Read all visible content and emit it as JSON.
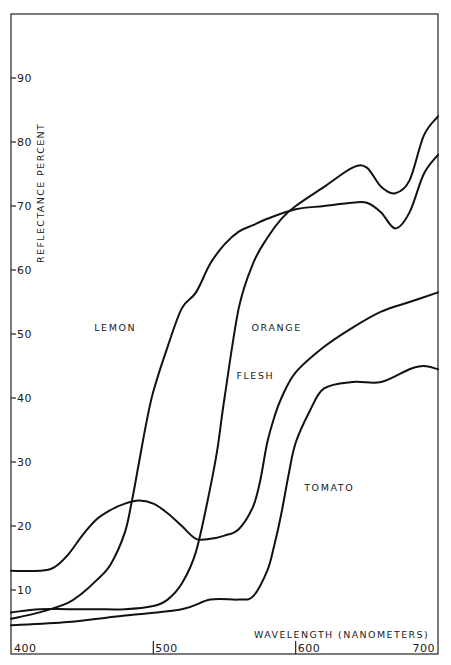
{
  "chart_data": {
    "type": "line",
    "title": "",
    "xlabel": "WAVELENGTH (NANOMETERS)",
    "ylabel": "REFLECTANCE PERCENT",
    "xlim": [
      400,
      700
    ],
    "ylim": [
      0,
      100
    ],
    "grid": false,
    "legend": "inline labels",
    "x_ticks": [
      {
        "value": 400,
        "label": "400"
      },
      {
        "value": 500,
        "label": "500"
      },
      {
        "value": 600,
        "label": "600"
      },
      {
        "value": 700,
        "label": "700"
      }
    ],
    "y_ticks": [
      {
        "value": 10,
        "label": "10"
      },
      {
        "value": 20,
        "label": "20"
      },
      {
        "value": 30,
        "label": "30"
      },
      {
        "value": 40,
        "label": "40"
      },
      {
        "value": 50,
        "label": "50"
      },
      {
        "value": 60,
        "label": "60"
      },
      {
        "value": 70,
        "label": "70"
      },
      {
        "value": 80,
        "label": "80"
      },
      {
        "value": 90,
        "label": "90"
      }
    ],
    "series": [
      {
        "name": "LEMON",
        "label_pos": {
          "x": 488,
          "y": 50.5
        },
        "x": [
          400,
          420,
          440,
          450,
          460,
          470,
          480,
          485,
          490,
          495,
          500,
          510,
          520,
          530,
          540,
          550,
          560,
          570,
          580,
          600,
          620,
          640,
          650,
          660,
          670,
          680,
          690,
          700
        ],
        "values": [
          5.5,
          6.5,
          8,
          9.5,
          11.5,
          14,
          19,
          24,
          30,
          36,
          41,
          48,
          54,
          56.5,
          61,
          64,
          66,
          67,
          68,
          69.5,
          70,
          70.5,
          70.5,
          69,
          66.5,
          69,
          75,
          78
        ]
      },
      {
        "name": "ORANGE",
        "label_pos": {
          "x": 569,
          "y": 50.5
        },
        "x": [
          400,
          420,
          440,
          460,
          480,
          500,
          510,
          520,
          530,
          540,
          545,
          550,
          560,
          570,
          580,
          590,
          600,
          620,
          640,
          650,
          660,
          670,
          680,
          690,
          700
        ],
        "values": [
          6.5,
          7,
          7,
          7,
          7,
          7.5,
          8.5,
          11,
          16,
          26,
          32,
          40,
          54,
          61,
          65,
          68,
          70,
          73,
          76,
          76,
          73,
          72,
          74,
          81,
          84
        ]
      },
      {
        "name": "FLESH",
        "label_pos": {
          "x": 585,
          "y": 43
        },
        "x": [
          400,
          420,
          430,
          440,
          450,
          460,
          470,
          480,
          490,
          500,
          510,
          520,
          530,
          540,
          550,
          560,
          570,
          575,
          580,
          585,
          590,
          600,
          620,
          640,
          660,
          680,
          700
        ],
        "values": [
          13,
          13,
          13.5,
          15.5,
          18.5,
          21,
          22.5,
          23.5,
          24,
          23.5,
          22,
          20,
          18,
          18,
          18.5,
          19.5,
          23,
          27,
          33,
          37,
          40,
          44,
          48,
          51,
          53.5,
          55,
          56.5
        ]
      },
      {
        "name": "TOMATO",
        "label_pos": {
          "x": 606,
          "y": 25.5
        },
        "x": [
          400,
          440,
          480,
          520,
          540,
          560,
          570,
          580,
          585,
          590,
          595,
          600,
          610,
          620,
          640,
          660,
          680,
          690,
          700
        ],
        "values": [
          4.5,
          5,
          6,
          7,
          8.5,
          8.5,
          9,
          13,
          17,
          22,
          28,
          33,
          38,
          41.5,
          42.5,
          42.5,
          44.5,
          45,
          44.5
        ]
      }
    ]
  }
}
